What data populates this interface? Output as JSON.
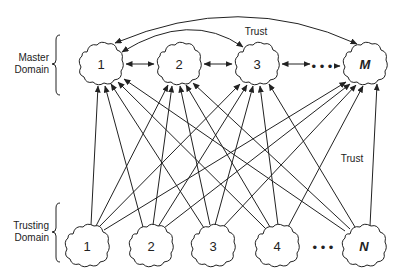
{
  "labels": {
    "master_domain": [
      "Master",
      "Domain"
    ],
    "trusting_domain": [
      "Trusting",
      "Domain"
    ],
    "trust_top": "Trust",
    "trust_right": "Trust",
    "ellipsis": "• • •"
  },
  "master_nodes": [
    {
      "label": "1",
      "emphasis": false
    },
    {
      "label": "2",
      "emphasis": false
    },
    {
      "label": "3",
      "emphasis": false
    },
    {
      "label": "M",
      "emphasis": true
    }
  ],
  "trusting_nodes": [
    {
      "label": "1",
      "emphasis": false
    },
    {
      "label": "2",
      "emphasis": false
    },
    {
      "label": "3",
      "emphasis": false
    },
    {
      "label": "4",
      "emphasis": false
    },
    {
      "label": "N",
      "emphasis": true
    }
  ],
  "relationships": {
    "master_to_master": "bidirectional trust between adjacent master domains",
    "trusting_to_master": "every trusting domain trusts every master domain"
  }
}
